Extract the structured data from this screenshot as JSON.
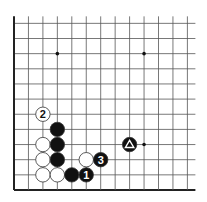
{
  "diagram": {
    "type": "go-board-fragment",
    "corner": "bottom-left",
    "grid": {
      "cols": 13,
      "rows": 12,
      "origin_x": 14,
      "origin_y": 190,
      "dx": 14.45,
      "dy": 15.15,
      "open_top": true,
      "open_right": true
    },
    "colors": {
      "line": "#555555",
      "edge": "#222222",
      "black_stone": "#111111",
      "white_stone": "#ffffff",
      "stone_outline": "#333333",
      "background": "#ffffff"
    },
    "star_points": [
      {
        "col": 3,
        "row": 9
      },
      {
        "col": 9,
        "row": 9
      },
      {
        "col": 9,
        "row": 3
      }
    ],
    "stones": [
      {
        "color": "white",
        "col": 2,
        "row": 5,
        "label": "2"
      },
      {
        "color": "black",
        "col": 3,
        "row": 4,
        "label": ""
      },
      {
        "color": "white",
        "col": 2,
        "row": 3,
        "label": ""
      },
      {
        "color": "black",
        "col": 3,
        "row": 3,
        "label": ""
      },
      {
        "color": "white",
        "col": 2,
        "row": 2,
        "label": ""
      },
      {
        "color": "black",
        "col": 3,
        "row": 2,
        "label": ""
      },
      {
        "color": "white",
        "col": 5,
        "row": 2,
        "label": ""
      },
      {
        "color": "black",
        "col": 6,
        "row": 2,
        "label": "3"
      },
      {
        "color": "white",
        "col": 2,
        "row": 1,
        "label": ""
      },
      {
        "color": "white",
        "col": 3,
        "row": 1,
        "label": ""
      },
      {
        "color": "black",
        "col": 4,
        "row": 1,
        "label": ""
      },
      {
        "color": "black",
        "col": 5,
        "row": 1,
        "label": "1"
      },
      {
        "color": "black",
        "col": 8,
        "row": 3,
        "label": "",
        "marker": "triangle"
      }
    ]
  }
}
